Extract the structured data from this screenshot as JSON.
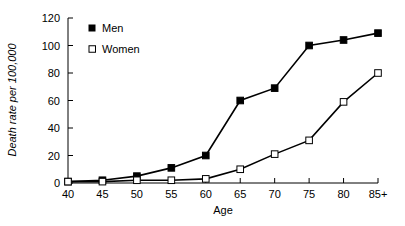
{
  "chart_data": {
    "type": "line",
    "title": "",
    "xlabel": "Age",
    "ylabel": "Death rate per 100,000",
    "categories": [
      "40",
      "45",
      "50",
      "55",
      "60",
      "65",
      "70",
      "75",
      "80",
      "85+"
    ],
    "xtick_labels": [
      "40",
      "45",
      "50",
      "55",
      "60",
      "65",
      "70",
      "75",
      "80",
      "85+"
    ],
    "ytick_labels": [
      "0",
      "20",
      "40",
      "60",
      "80",
      "100",
      "120"
    ],
    "ytick_values": [
      0,
      20,
      40,
      60,
      80,
      100,
      120
    ],
    "ylim": [
      0,
      120
    ],
    "grid": false,
    "legend_position": "top-left-inside",
    "series": [
      {
        "name": "Men",
        "marker": "filled-square",
        "color": "#000000",
        "values": [
          1,
          2,
          5,
          11,
          20,
          60,
          69,
          100,
          104,
          109
        ]
      },
      {
        "name": "Women",
        "marker": "open-square",
        "color": "#000000",
        "values": [
          1,
          1,
          2,
          2,
          3,
          10,
          21,
          31,
          59,
          80
        ]
      }
    ]
  },
  "legend": {
    "items": [
      {
        "label": "Men",
        "marker": "filled-square"
      },
      {
        "label": "Women",
        "marker": "open-square"
      }
    ]
  }
}
